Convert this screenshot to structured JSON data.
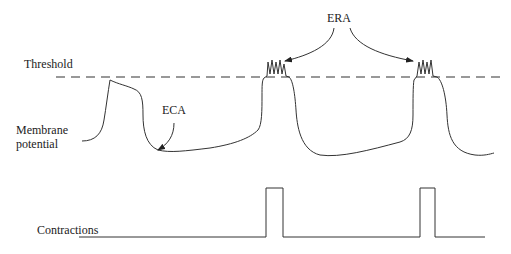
{
  "diagram": {
    "labels": {
      "threshold": "Threshold",
      "membrane_line1": "Membrane",
      "membrane_line2": "potential",
      "contractions": "Contractions",
      "eca": "ECA",
      "era": "ERA"
    },
    "colors": {
      "line": "#333333",
      "text": "#222222",
      "background": "#ffffff"
    }
  }
}
